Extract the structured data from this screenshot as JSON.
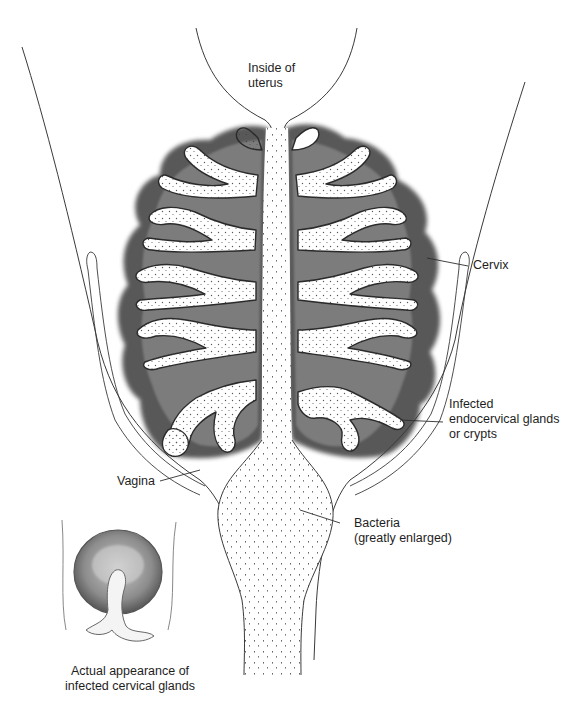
{
  "figure": {
    "colors": {
      "background": "#ffffff",
      "line": "#333333",
      "gland_shadow": "#2a2a2a",
      "gland_fill": "#ffffff",
      "stipple": "#444444",
      "text": "#1e1e1e"
    }
  },
  "labels": {
    "uterus": {
      "line1": "Inside of",
      "line2": "uterus"
    },
    "cervix": {
      "line1": "Cervix"
    },
    "glands": {
      "line1": "Infected",
      "line2": "endocervical glands",
      "line3": "or crypts"
    },
    "vagina": {
      "line1": "Vagina"
    },
    "bacteria": {
      "line1": "Bacteria",
      "line2": "(greatly enlarged)"
    },
    "inset": {
      "line1": "Actual appearance of",
      "line2": "infected cervical glands"
    }
  },
  "regions": [
    {
      "name": "inside-of-uterus",
      "label_ref": "labels.uterus"
    },
    {
      "name": "cervix",
      "label_ref": "labels.cervix"
    },
    {
      "name": "endocervical-glands",
      "label_ref": "labels.glands"
    },
    {
      "name": "vagina",
      "label_ref": "labels.vagina"
    },
    {
      "name": "cervical-canal-bacteria",
      "label_ref": "labels.bacteria"
    },
    {
      "name": "inset-view",
      "label_ref": "labels.inset"
    }
  ]
}
